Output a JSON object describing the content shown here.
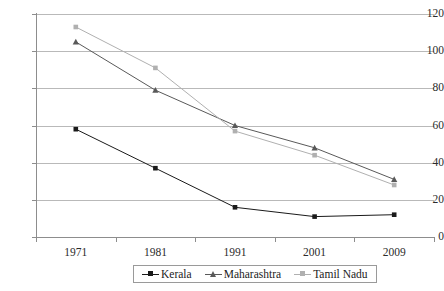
{
  "chart_data": {
    "type": "line",
    "title": "",
    "subtitle": "",
    "xlabel": "",
    "ylabel": "",
    "categories": [
      "1971",
      "1981",
      "1991",
      "2001",
      "2009"
    ],
    "x_tick_labels": [
      "1971",
      "1981",
      "1991",
      "2001",
      "2009"
    ],
    "y_tick_labels": [
      "0",
      "20",
      "40",
      "60",
      "80",
      "100",
      "120"
    ],
    "y_ticks": [
      0,
      20,
      40,
      60,
      80,
      100,
      120
    ],
    "ylim": [
      0,
      120
    ],
    "grid": "horizontal",
    "legend_position": "bottom",
    "series": [
      {
        "name": "Kerala",
        "values": [
          58,
          37,
          16,
          11,
          12
        ],
        "color": "#1a1a1a",
        "marker": "square"
      },
      {
        "name": "Maharashtra",
        "values": [
          105,
          79,
          60,
          48,
          31
        ],
        "color": "#595959",
        "marker": "triangle"
      },
      {
        "name": "Tamil Nadu",
        "values": [
          113,
          91,
          57,
          44,
          28
        ],
        "color": "#b0b0b0",
        "marker": "square"
      }
    ]
  },
  "legend": {
    "items": [
      {
        "label": "Kerala"
      },
      {
        "label": "Maharashtra"
      },
      {
        "label": "Tamil Nadu"
      }
    ]
  },
  "colors": {
    "background": "#ffffff",
    "grid": "#b9b9b9",
    "axis": "#8d8d8d",
    "tick_text": "#2b2b2b",
    "legend_border": "#9a9a9a"
  }
}
